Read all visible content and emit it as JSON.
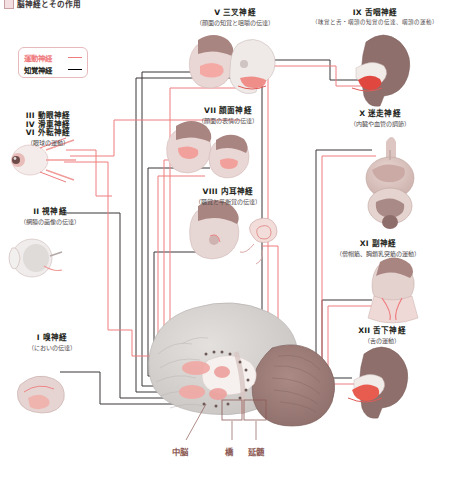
{
  "header": {
    "swatch_icon": "square-swatch-icon",
    "title": "脳神経とその作用"
  },
  "legend": {
    "motor": {
      "label": "運動神経",
      "color": "#ef7c7f",
      "line_icon": "line-swatch-icon"
    },
    "sensory": {
      "label": "知覚神経",
      "color": "#231f20",
      "line_icon": "line-swatch-icon"
    }
  },
  "nerves": {
    "left": [
      {
        "numeral_lines": [
          "III 動眼神経",
          "IV 滑車神経",
          "VI 外転神経"
        ],
        "title": "III 動眼神経",
        "title2": "IV 滑車神経",
        "title3": "VI 外転神経",
        "sub": "（眼球の運動）",
        "illustration": "eye-muscles-illustration"
      },
      {
        "title": "II 視神経",
        "sub": "（網膜の画像の伝達）",
        "illustration": "eyeball-retina-illustration"
      },
      {
        "title": "I 嗅神経",
        "sub": "（においの伝達）",
        "illustration": "nasal-cavity-illustration"
      }
    ],
    "center": [
      {
        "title": "V 三叉神経",
        "sub": "（顔面の知覚と咀嚼の伝達）",
        "illustration": "face-and-skull-illustration"
      },
      {
        "title": "VII 顔面神経",
        "sub": "（顔面の表情の伝達）",
        "illustration": "facial-expression-illustration"
      },
      {
        "title": "VIII 内耳神経",
        "sub": "（聴覚と平衡覚の伝達）",
        "illustration": "inner-ear-illustration"
      }
    ],
    "right": [
      {
        "title": "IX 舌咽神経",
        "sub": "（味覚と舌・咽頭の知覚の伝達、咽頭の運動）",
        "illustration": "tongue-pharynx-illustration"
      },
      {
        "title": "X 迷走神経",
        "sub": "（内臓や血管の調節）",
        "illustration": "internal-organs-illustration"
      },
      {
        "title": "XI 副神経",
        "sub": "（僧帽筋、胸鎖乳突筋の運動）",
        "illustration": "neck-shoulder-muscles-illustration"
      },
      {
        "title": "XII 舌下神経",
        "sub": "（舌の運動）",
        "illustration": "tongue-motion-illustration"
      }
    ]
  },
  "brain": {
    "illustration": "sagittal-brain-illustration",
    "regions": [
      {
        "label": "中脳"
      },
      {
        "label": "橋"
      },
      {
        "label": "延髄"
      }
    ]
  },
  "colors": {
    "motor": "#ef7c7f",
    "sensory": "#231f20",
    "brain_label": "#8d5a55",
    "cerebrum": "#d6d3d1",
    "cerebellum": "#9d7d79",
    "pink_structure": "#f0a8a4",
    "background": "#ffffff"
  }
}
